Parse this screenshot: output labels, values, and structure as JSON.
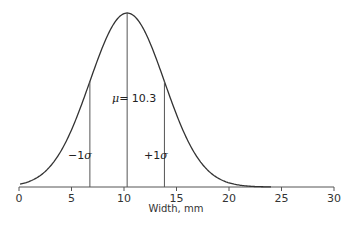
{
  "chart_data": {
    "type": "line",
    "title": "",
    "xlabel": "Width, mm",
    "ylabel": "",
    "xlim": [
      0,
      30
    ],
    "xticks": [
      0,
      5,
      10,
      15,
      20,
      25,
      30
    ],
    "grid": false,
    "series": [
      {
        "name": "Normal distribution",
        "mean": 10.3,
        "sigma": 3.55
      }
    ],
    "annotations": {
      "mean_label": "μ= 10.3",
      "minus_sigma_label": "−1σ",
      "plus_sigma_label": "+1σ",
      "mean_x": 10.3,
      "minus_sigma_x": 6.75,
      "plus_sigma_x": 13.85
    }
  },
  "labels": {
    "xlabel": "Width, mm",
    "mu_symbol": "μ",
    "mu_value": "= 10.3",
    "minus_sigma_prefix": "−1",
    "plus_sigma_prefix": "+1",
    "sigma_symbol": "σ",
    "ticks": [
      "0",
      "5",
      "10",
      "15",
      "20",
      "25",
      "30"
    ]
  }
}
